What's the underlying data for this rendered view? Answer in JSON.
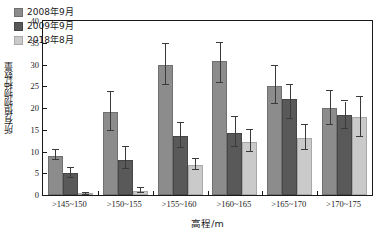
{
  "chart_data": {
    "type": "bar",
    "title": "",
    "xlabel": "高程/m",
    "ylabel": "所有植物物种数量",
    "categories": [
      ">145~150",
      ">150~155",
      ">155~160",
      ">160~165",
      ">165~170",
      ">170~175"
    ],
    "ylim": [
      0,
      40
    ],
    "yticks": [
      0,
      5,
      10,
      15,
      20,
      25,
      30,
      35,
      40
    ],
    "grid": false,
    "legend_position": "top-left",
    "series": [
      {
        "name": "2008年9月",
        "color": "#8c8c8c",
        "values": [
          9.0,
          19.0,
          30.0,
          30.7,
          25.0,
          20.0
        ],
        "err_low": [
          1.0,
          4.3,
          4.6,
          5.0,
          4.0,
          4.0
        ],
        "err_high": [
          1.3,
          4.6,
          4.7,
          4.3,
          4.6,
          4.0
        ]
      },
      {
        "name": "2009年9月",
        "color": "#595959",
        "values": [
          5.0,
          8.0,
          13.5,
          14.3,
          22.0,
          18.5
        ],
        "err_low": [
          1.0,
          2.0,
          2.6,
          3.3,
          4.6,
          3.3
        ],
        "err_high": [
          1.3,
          3.0,
          3.0,
          3.7,
          3.3,
          3.0
        ]
      },
      {
        "name": "2018年8月",
        "color": "#cacaca",
        "values": [
          0.3,
          1.0,
          7.0,
          12.3,
          13.0,
          18.0
        ],
        "err_low": [
          0.2,
          0.5,
          1.3,
          2.3,
          2.6,
          4.6
        ],
        "err_high": [
          0.2,
          0.6,
          1.3,
          2.6,
          3.0,
          4.6
        ]
      }
    ]
  },
  "legend": {
    "items": [
      {
        "label": "2008年9月"
      },
      {
        "label": "2009年9月"
      },
      {
        "label": "2018年8月"
      }
    ]
  }
}
